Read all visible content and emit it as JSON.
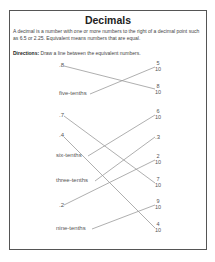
{
  "worksheet": {
    "title": "Decimals",
    "intro": "A decimal is a number with one or more numbers to the right of a decimal point such as 6.5 or 2.25. Equivalent means numbers that are equal.",
    "directions_label": "Directions:",
    "directions_text": " Draw a line between the equivalent numbers.",
    "left_items": [
      {
        "label": ".8",
        "y": 65
      },
      {
        "label": "five-tenths",
        "y": 93
      },
      {
        "label": ".7",
        "y": 115
      },
      {
        "label": ".4",
        "y": 135
      },
      {
        "label": "six-tenths",
        "y": 155
      },
      {
        "label": "three-tenths",
        "y": 180
      },
      {
        "label": ".2",
        "y": 205
      },
      {
        "label": "nine-tenths",
        "y": 228
      }
    ],
    "right_items": [
      {
        "num": "5",
        "den": "10",
        "y": 67
      },
      {
        "num": "8",
        "den": "10",
        "y": 90
      },
      {
        "num": "6",
        "den": "10",
        "y": 115
      },
      {
        "label": ".3",
        "y": 137
      },
      {
        "num": "2",
        "den": "10",
        "y": 160
      },
      {
        "num": "7",
        "den": "10",
        "y": 183
      },
      {
        "num": "9",
        "den": "10",
        "y": 205
      },
      {
        "num": "4",
        "den": "10",
        "y": 228
      }
    ],
    "matches": [
      {
        "from": ".8",
        "to": "8/10"
      },
      {
        "from": "five-tenths",
        "to": "5/10"
      },
      {
        "from": ".7",
        "to": "7/10"
      },
      {
        "from": ".4",
        "to": "4/10"
      },
      {
        "from": "six-tenths",
        "to": "6/10"
      },
      {
        "from": "three-tenths",
        "to": ".3"
      },
      {
        "from": ".2",
        "to": "2/10"
      },
      {
        "from": "nine-tenths",
        "to": "9/10"
      }
    ]
  }
}
